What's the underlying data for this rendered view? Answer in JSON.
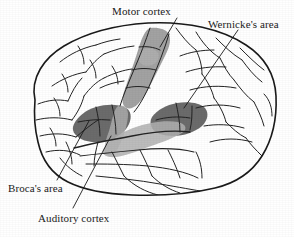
{
  "figure": {
    "background_color": "#ffffff",
    "ink_color": "#1a1a1a"
  },
  "labels": {
    "motor_cortex": "Motor cortex",
    "wernickes_area": "Wernicke's area",
    "brocas_area": "Broca's area",
    "auditory_cortex": "Auditory cortex"
  },
  "regions": [
    {
      "key": "motor_cortex",
      "name": "Motor cortex",
      "shade": "#9a9a9a",
      "description": "Medium gray strip running diagonally down from the vertex along the precentral gyrus"
    },
    {
      "key": "brocas_area",
      "name": "Broca's area",
      "shade": "#636363",
      "description": "Dark gray patch in the inferior frontal gyrus"
    },
    {
      "key": "wernickes_area",
      "name": "Wernicke's area",
      "shade": "#636363",
      "description": "Dark gray patch in the posterior superior temporal region"
    },
    {
      "key": "auditory_cortex",
      "name": "Auditory cortex",
      "shade": "#a8a8a8",
      "description": "Medium gray band along the Sylvian fissure on the superior temporal gyrus"
    }
  ],
  "colors": {
    "outline": "#1a1a1a",
    "sulci": "#2a2a2a",
    "dark_shade": "#636363",
    "mid_shade": "#9a9a9a",
    "light_shade": "#b4b4b4",
    "paper": "#ffffff"
  },
  "leader_lines": [
    {
      "key": "motor_cortex",
      "from": [
        177,
        18
      ],
      "to": [
        160,
        47
      ]
    },
    {
      "key": "wernickes_area",
      "from": [
        238,
        30
      ],
      "to": [
        184,
        108
      ]
    },
    {
      "key": "brocas_area",
      "from": [
        57,
        180
      ],
      "to": [
        89,
        121
      ]
    },
    {
      "key": "auditory_cortex",
      "from": [
        73,
        208
      ],
      "to": [
        111,
        136
      ]
    }
  ]
}
